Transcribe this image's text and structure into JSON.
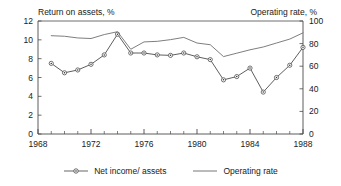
{
  "chart_data": {
    "type": "line",
    "title": "",
    "xlabel": "",
    "axis_titles": {
      "left": "Return on assets, %",
      "right": "Operating rate, %"
    },
    "x": [
      1969,
      1970,
      1971,
      1972,
      1973,
      1974,
      1975,
      1976,
      1977,
      1978,
      1979,
      1980,
      1981,
      1982,
      1983,
      1984,
      1985,
      1986,
      1987,
      1988
    ],
    "xlim": [
      1968,
      1988
    ],
    "xticks": [
      1968,
      1972,
      1976,
      1980,
      1984,
      1988
    ],
    "xticklabels": [
      "1968",
      "1972",
      "1976",
      "1980",
      "1984",
      "1988"
    ],
    "x_minor_tick_interval": 1,
    "ylim_left": [
      0,
      12
    ],
    "yticks_left": [
      0,
      2,
      4,
      6,
      8,
      10,
      12
    ],
    "yticklabels_left": [
      "0",
      "2",
      "4",
      "6",
      "8",
      "10",
      "12"
    ],
    "ylim_right": [
      0,
      100
    ],
    "yticks_right": [
      0,
      20,
      40,
      60,
      80,
      100
    ],
    "yticklabels_right": [
      "0",
      "20",
      "40",
      "60",
      "80",
      "100"
    ],
    "grid": false,
    "legend_position": "below",
    "series": [
      {
        "name": "Net income/ assets",
        "axis": "left",
        "marker": "circle-dot",
        "color": "#555555",
        "values": [
          7.5,
          6.5,
          6.8,
          7.4,
          8.4,
          10.6,
          8.6,
          8.6,
          8.4,
          8.35,
          8.6,
          8.2,
          7.9,
          5.75,
          6.1,
          7.0,
          4.45,
          6.0,
          7.3,
          9.2
        ]
      },
      {
        "name": "Operating rate",
        "axis": "right",
        "marker": "none",
        "color": "#777777",
        "values": [
          87.0,
          86.5,
          85.0,
          84.5,
          88.0,
          90.5,
          75.0,
          81.5,
          82.0,
          83.5,
          85.5,
          80.5,
          79.0,
          68.5,
          71.5,
          74.5,
          77.0,
          80.5,
          84.0,
          89.5
        ]
      }
    ]
  },
  "legend": {
    "items": [
      {
        "label": "Net income/ assets"
      },
      {
        "label": "Operating rate"
      }
    ]
  }
}
